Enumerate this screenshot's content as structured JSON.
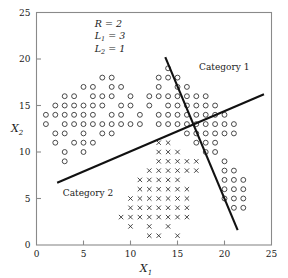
{
  "chart_data": {
    "type": "scatter",
    "title": "",
    "xlabel": "X1",
    "ylabel": "X2",
    "xlim": [
      0,
      25
    ],
    "ylim": [
      0,
      25
    ],
    "xticks": [
      "0",
      "5",
      "10",
      "15",
      "20",
      "25"
    ],
    "yticks": [
      "0",
      "5",
      "10",
      "15",
      "20",
      "25"
    ],
    "xtick_values": [
      0,
      5,
      10,
      15,
      20,
      25
    ],
    "ytick_values": [
      0,
      5,
      10,
      15,
      20,
      25
    ],
    "grid": false,
    "legend_position": "in-plot-annotations",
    "series": [
      {
        "name": "Category 1",
        "marker": "circle",
        "points": [
          [
            1,
            14
          ],
          [
            1,
            13
          ],
          [
            2,
            15
          ],
          [
            2,
            14
          ],
          [
            2,
            12
          ],
          [
            2,
            11
          ],
          [
            3,
            16
          ],
          [
            3,
            15
          ],
          [
            3,
            14
          ],
          [
            3,
            13
          ],
          [
            3,
            12
          ],
          [
            3,
            10
          ],
          [
            3,
            9
          ],
          [
            4,
            16
          ],
          [
            4,
            15
          ],
          [
            4,
            14
          ],
          [
            4,
            13
          ],
          [
            4,
            11
          ],
          [
            5,
            17
          ],
          [
            5,
            15
          ],
          [
            5,
            14
          ],
          [
            5,
            13
          ],
          [
            5,
            12
          ],
          [
            5,
            11
          ],
          [
            5,
            10
          ],
          [
            6,
            17
          ],
          [
            6,
            16
          ],
          [
            6,
            15
          ],
          [
            6,
            14
          ],
          [
            6,
            13
          ],
          [
            6,
            11
          ],
          [
            7,
            18
          ],
          [
            7,
            16
          ],
          [
            7,
            15
          ],
          [
            7,
            13
          ],
          [
            7,
            12
          ],
          [
            8,
            18
          ],
          [
            8,
            17
          ],
          [
            8,
            16
          ],
          [
            8,
            14
          ],
          [
            8,
            13
          ],
          [
            8,
            12
          ],
          [
            9,
            17
          ],
          [
            9,
            15
          ],
          [
            9,
            14
          ],
          [
            9,
            13
          ],
          [
            10,
            16
          ],
          [
            10,
            15
          ],
          [
            10,
            13
          ],
          [
            11,
            14
          ],
          [
            11,
            13
          ],
          [
            12,
            16
          ],
          [
            12,
            15
          ],
          [
            13,
            18
          ],
          [
            13,
            17
          ],
          [
            13,
            16
          ],
          [
            13,
            14
          ],
          [
            13,
            13
          ],
          [
            14,
            19
          ],
          [
            14,
            18
          ],
          [
            14,
            16
          ],
          [
            14,
            15
          ],
          [
            14,
            14
          ],
          [
            14,
            13
          ],
          [
            15,
            18
          ],
          [
            15,
            17
          ],
          [
            15,
            16
          ],
          [
            15,
            15
          ],
          [
            15,
            14
          ],
          [
            15,
            13
          ],
          [
            16,
            17
          ],
          [
            16,
            16
          ],
          [
            16,
            15
          ],
          [
            16,
            14
          ],
          [
            16,
            13
          ],
          [
            16,
            12
          ],
          [
            17,
            16
          ],
          [
            17,
            15
          ],
          [
            17,
            14
          ],
          [
            17,
            13
          ],
          [
            17,
            12
          ],
          [
            17,
            11
          ],
          [
            18,
            16
          ],
          [
            18,
            15
          ],
          [
            18,
            14
          ],
          [
            18,
            13
          ],
          [
            18,
            12
          ],
          [
            18,
            11
          ],
          [
            18,
            10
          ],
          [
            19,
            15
          ],
          [
            19,
            14
          ],
          [
            19,
            13
          ],
          [
            19,
            12
          ],
          [
            19,
            11
          ],
          [
            19,
            10
          ],
          [
            20,
            14
          ],
          [
            20,
            13
          ],
          [
            20,
            12
          ],
          [
            20,
            9
          ],
          [
            20,
            8
          ],
          [
            20,
            7
          ],
          [
            20,
            6
          ],
          [
            20,
            5
          ],
          [
            21,
            13
          ],
          [
            21,
            12
          ],
          [
            21,
            8
          ],
          [
            21,
            7
          ],
          [
            21,
            6
          ],
          [
            21,
            5
          ],
          [
            21,
            4
          ],
          [
            22,
            7
          ],
          [
            22,
            6
          ],
          [
            22,
            5
          ],
          [
            22,
            4
          ]
        ]
      },
      {
        "name": "Category 2",
        "marker": "x",
        "points": [
          [
            9,
            3
          ],
          [
            10,
            5
          ],
          [
            10,
            4
          ],
          [
            10,
            3
          ],
          [
            10,
            2
          ],
          [
            11,
            7
          ],
          [
            11,
            6
          ],
          [
            11,
            5
          ],
          [
            11,
            4
          ],
          [
            11,
            3
          ],
          [
            12,
            8
          ],
          [
            12,
            7
          ],
          [
            12,
            6
          ],
          [
            12,
            5
          ],
          [
            12,
            4
          ],
          [
            12,
            3
          ],
          [
            12,
            2
          ],
          [
            12,
            1
          ],
          [
            13,
            11
          ],
          [
            13,
            10
          ],
          [
            13,
            9
          ],
          [
            13,
            8
          ],
          [
            13,
            7
          ],
          [
            13,
            6
          ],
          [
            13,
            5
          ],
          [
            13,
            4
          ],
          [
            13,
            3
          ],
          [
            13,
            1
          ],
          [
            14,
            11
          ],
          [
            14,
            10
          ],
          [
            14,
            9
          ],
          [
            14,
            8
          ],
          [
            14,
            7
          ],
          [
            14,
            6
          ],
          [
            14,
            5
          ],
          [
            14,
            4
          ],
          [
            14,
            3
          ],
          [
            14,
            2
          ],
          [
            15,
            10
          ],
          [
            15,
            9
          ],
          [
            15,
            8
          ],
          [
            15,
            7
          ],
          [
            15,
            6
          ],
          [
            15,
            5
          ],
          [
            15,
            4
          ],
          [
            15,
            3
          ],
          [
            15,
            1
          ],
          [
            16,
            9
          ],
          [
            16,
            8
          ],
          [
            16,
            6
          ],
          [
            16,
            5
          ],
          [
            16,
            4
          ],
          [
            16,
            3
          ],
          [
            17,
            9
          ],
          [
            17,
            8
          ]
        ]
      }
    ],
    "boundaries": [
      {
        "name": "boundary-line-1",
        "x1": 13.7,
        "y1": 20.2,
        "x2": 21.4,
        "y2": 1.6
      },
      {
        "name": "boundary-line-2",
        "x1": 2.2,
        "y1": 6.7,
        "x2": 24.2,
        "y2": 16.2
      }
    ],
    "annotations": [
      {
        "name": "param-R",
        "symbol": "R",
        "subscript": "",
        "text": " = 2",
        "x": 6.2,
        "y": 23.4
      },
      {
        "name": "param-L1",
        "symbol": "L",
        "subscript": "1",
        "text": " = 3",
        "x": 6.2,
        "y": 22.1
      },
      {
        "name": "param-L2",
        "symbol": "L",
        "subscript": "2",
        "text": " = 1",
        "x": 6.2,
        "y": 20.8
      }
    ],
    "category_labels": [
      {
        "name": "category-1-label",
        "text": "Category 1",
        "x": 17.3,
        "y": 18.8
      },
      {
        "name": "category-2-label",
        "text": "Category 2",
        "x": 2.8,
        "y": 5.3
      }
    ]
  },
  "axis": {
    "x_label_main": "X",
    "x_label_sub": "1",
    "y_label_main": "X",
    "y_label_sub": "2"
  }
}
